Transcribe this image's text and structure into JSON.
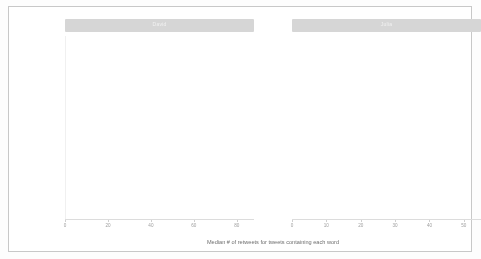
{
  "figure": {
    "background": "#ffffff",
    "border_color": "#c8c8c8",
    "bar_color": "#c2c2c2",
    "strip_color": "#d6d6d6"
  },
  "axis": {
    "xlabel": "Median # of retweets for tweets containing each word"
  },
  "chart_data": {
    "type": "bar",
    "orientation": "horizontal",
    "title": "",
    "xlabel": "Median # of retweets for tweets containing each word",
    "ylabel": "",
    "grid": true,
    "legend": null,
    "facets": [
      {
        "name": "David",
        "strip_label": "David",
        "xlim": [
          0,
          88
        ],
        "xticks": [
          0,
          20,
          40,
          60,
          80
        ],
        "xticklabels": [
          "0",
          "20",
          "40",
          "60",
          "80"
        ],
        "categories": [
          "animation",
          "download",
          "start",
          "introducing",
          "appreciate",
          "understanding",
          "2",
          "error",
          "modeling",
          "bayesian"
        ],
        "values": [
          76,
          40,
          40,
          34,
          34,
          34,
          28,
          26,
          26,
          26
        ]
      },
      {
        "name": "Julia",
        "strip_label": "Julia",
        "xlim": [
          0,
          55
        ],
        "xticks": [
          0,
          10,
          20,
          30,
          40,
          50
        ],
        "xticklabels": [
          "0",
          "10",
          "20",
          "30",
          "40",
          "50"
        ],
        "categories": [
          "tidytext",
          "text",
          "tidy",
          "mining",
          "gift",
          "post",
          "mapping",
          "praiseworthy",
          "#rstatsladies",
          "sentiment",
          "project",
          "@drob"
        ],
        "values": [
          47,
          29,
          11,
          12,
          7,
          6,
          6,
          6,
          5,
          4,
          4,
          3
        ]
      }
    ]
  }
}
